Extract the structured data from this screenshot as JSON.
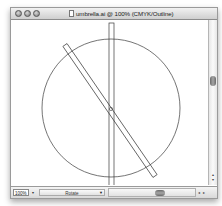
{
  "window": {
    "title": "umbrella.ai @ 100% (CMYK/Outline)",
    "buttons": [
      "close",
      "minimize",
      "zoom"
    ]
  },
  "canvas": {
    "view_mode": "Outline",
    "shapes": [
      {
        "type": "circle",
        "cx": 100,
        "cy": 88,
        "r": 69
      },
      {
        "type": "rect",
        "name": "vertical-bar",
        "x": 98,
        "y": 3,
        "width": 5,
        "height": 172,
        "rotation": 0
      },
      {
        "type": "rect",
        "name": "tilted-bar",
        "cx": 99,
        "cy": 90.5,
        "width": 5,
        "height": 159,
        "rotation": -34.5
      }
    ]
  },
  "statusbar": {
    "zoom_value": "100%",
    "zoom_menu_icon": "triangle-down",
    "status_label": "Rotate",
    "status_menu_icon": "triangle-down",
    "scroll_arrows": "◂ ▸"
  },
  "vscroll": {
    "up_arrow": "▴",
    "down_arrow": "▾"
  }
}
